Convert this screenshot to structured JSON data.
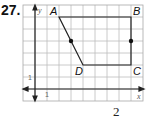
{
  "problem": {
    "number": "27."
  },
  "graph": {
    "grid": {
      "cols": 10,
      "rows": 8,
      "cell_px": 12,
      "origin_px": [
        23,
        5
      ],
      "line_color": "#b8b8b8",
      "border_color": "#9a9a9a"
    },
    "axes": {
      "x_label": "x",
      "y_label": "y",
      "x_tick_label": "1",
      "y_tick_label": "1",
      "origin_grid": [
        1,
        7
      ]
    },
    "shape": {
      "type": "quadrilateral",
      "vertices": [
        {
          "name": "A",
          "x": 2,
          "y": 6
        },
        {
          "name": "B",
          "x": 8,
          "y": 6
        },
        {
          "name": "C",
          "x": 8,
          "y": 2
        },
        {
          "name": "D",
          "x": 4,
          "y": 2
        }
      ],
      "midpoints": [
        {
          "on": "AD",
          "x": 3,
          "y": 4
        },
        {
          "on": "BC",
          "x": 8,
          "y": 4
        }
      ],
      "stroke": "#222222"
    }
  },
  "footer": {
    "text": "2"
  }
}
